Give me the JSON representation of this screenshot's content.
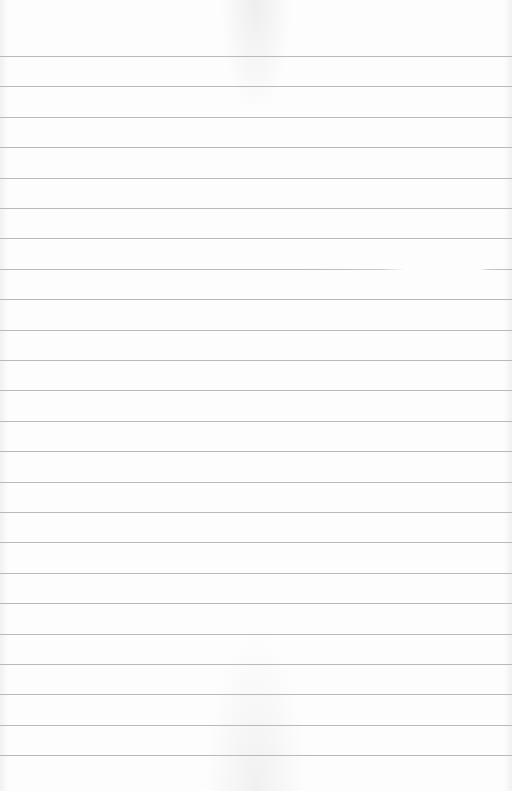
{
  "page": {
    "type": "blank lined paper",
    "background_color": "#fdfdfd",
    "line_color": "#b9b9b9",
    "line_count": 24,
    "first_line_y": 56,
    "line_spacing": 30.4,
    "faded_line_index": 7
  }
}
